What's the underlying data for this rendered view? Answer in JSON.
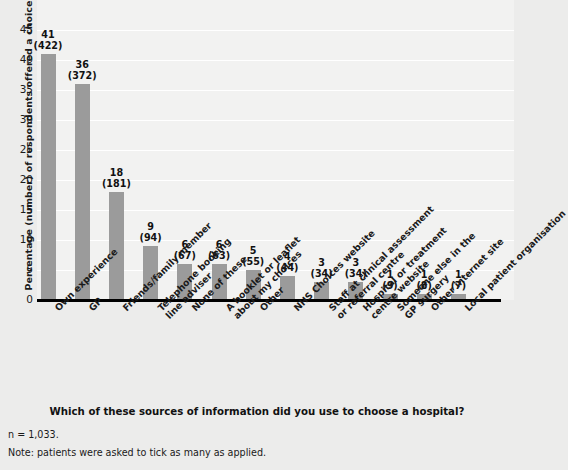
{
  "chart_data": {
    "type": "bar",
    "title": "",
    "xlabel": "",
    "ylabel": "Percentage (number) of respondents offered a choice",
    "ylim": [
      0,
      45
    ],
    "ytick_step": 5,
    "yticks": [
      0,
      5,
      10,
      15,
      20,
      25,
      30,
      35,
      40,
      45
    ],
    "grid": true,
    "legend": "none",
    "bar_color": "#9b9b9b",
    "plot_background": "#f2f2f1",
    "figure_background": "#ececeb",
    "categories": [
      "Own experience",
      "GP",
      "Friends/family member",
      "Telephone booking\nline adviser",
      "None of these",
      "A booklet or leaflet\nabout my choices",
      "Other",
      "NHS Choices website",
      "Staff at clinical assessment\nor referral centre",
      "Hospital or treatment\ncentre website",
      "Someone else in the\nGP surgery",
      "Other internet site",
      "Local patient organisation"
    ],
    "values": [
      41,
      36,
      18,
      9,
      6,
      6,
      5,
      4,
      3,
      3,
      1,
      1,
      1
    ],
    "counts": [
      422,
      372,
      181,
      94,
      67,
      63,
      55,
      44,
      34,
      34,
      9,
      8,
      7
    ],
    "data_labels": [
      "41\n(422)",
      "36\n(372)",
      "18\n(181)",
      "9\n(94)",
      "6\n(67)",
      "6\n(63)",
      "5\n(55)",
      "4\n(44)",
      "3\n(34)",
      "3\n(34)",
      "1\n(9)",
      "1\n(8)",
      "1\n(7)"
    ]
  },
  "caption": {
    "question": "Which of these sources of information did you use to choose a hospital?",
    "n_line": "n = 1,033.",
    "note_line": "Note: patients were asked to tick as many as applied."
  }
}
